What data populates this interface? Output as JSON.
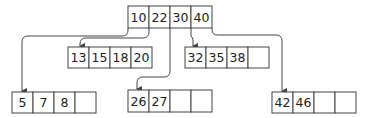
{
  "diagram": {
    "type": "b-tree",
    "stroke_color": "#444444",
    "text_color": "#222222",
    "nodes": [
      {
        "id": "root",
        "keys": [
          "10",
          "22",
          "30",
          "40"
        ],
        "x": 128,
        "y": 6,
        "cells": 4
      },
      {
        "id": "child0",
        "keys": [
          "5",
          "7",
          "8",
          ""
        ],
        "x": 12,
        "y": 92,
        "cells": 4
      },
      {
        "id": "child1",
        "keys": [
          "13",
          "15",
          "18",
          "20"
        ],
        "x": 68,
        "y": 47,
        "cells": 4
      },
      {
        "id": "child2",
        "keys": [
          "26",
          "27",
          "",
          ""
        ],
        "x": 128,
        "y": 90,
        "cells": 4
      },
      {
        "id": "child3",
        "keys": [
          "32",
          "35",
          "38",
          ""
        ],
        "x": 185,
        "y": 47,
        "cells": 4
      },
      {
        "id": "child4",
        "keys": [
          "42",
          "46",
          "",
          ""
        ],
        "x": 272,
        "y": 92,
        "cells": 4
      }
    ],
    "edges": [
      {
        "from": "root",
        "pointer": 0,
        "to": "child0"
      },
      {
        "from": "root",
        "pointer": 1,
        "to": "child1"
      },
      {
        "from": "root",
        "pointer": 2,
        "to": "child2"
      },
      {
        "from": "root",
        "pointer": 3,
        "to": "child3"
      },
      {
        "from": "root",
        "pointer": 4,
        "to": "child4"
      }
    ]
  }
}
